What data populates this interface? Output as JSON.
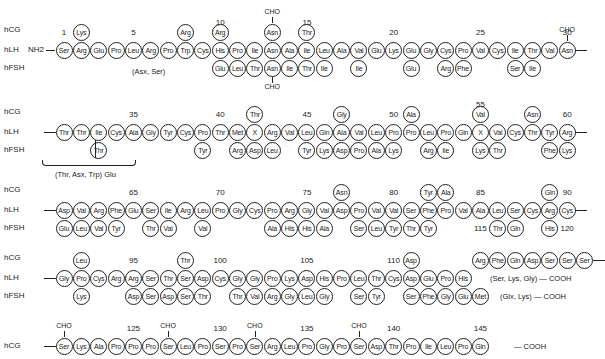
{
  "layout": {
    "x0": 64,
    "pitch": 17.35
  },
  "rows": [
    {
      "y": 50,
      "labels": {
        "hCG": "hCG",
        "hLH": "hLH",
        "hFSH": "hFSH"
      },
      "start_text": "NH2",
      "main": [
        "Ser",
        "Arg",
        "Glu",
        "Pro",
        "Leu",
        "Arg",
        "Pro",
        "Trp",
        "Cys",
        "His",
        "Pro",
        "Ile",
        "Asn",
        "Ala",
        "Ile",
        "Leu",
        "Ala",
        "Val",
        "Glu",
        "Lys",
        "Glu",
        "Gly",
        "Cys",
        "Pro",
        "Val",
        "Cys",
        "Ile",
        "Thr",
        "Val",
        "Asn"
      ],
      "numbers": [
        {
          "i": 0,
          "text": "1"
        },
        {
          "i": 4,
          "text": "5"
        },
        {
          "i": 9,
          "text": "10"
        },
        {
          "i": 14,
          "text": "15"
        },
        {
          "i": 19,
          "text": "20"
        },
        {
          "i": 24,
          "text": "25"
        },
        {
          "i": 29,
          "text": "30"
        }
      ],
      "above": [
        {
          "i": 1,
          "aa": "Lys"
        },
        {
          "i": 7,
          "aa": "Arg"
        },
        {
          "i": 9,
          "aa": "Arg"
        },
        {
          "i": 12,
          "aa": "Asn"
        },
        {
          "i": 14,
          "aa": "Thr"
        }
      ],
      "below": [
        {
          "i": 9,
          "aa": "Glu"
        },
        {
          "i": 10,
          "aa": "Leu"
        },
        {
          "i": 11,
          "aa": "Thr"
        },
        {
          "i": 12,
          "aa": "Asn"
        },
        {
          "i": 13,
          "aa": "Ile"
        },
        {
          "i": 14,
          "aa": "Thr"
        },
        {
          "i": 15,
          "aa": "Ile"
        },
        {
          "i": 17,
          "aa": "Ile"
        },
        {
          "i": 20,
          "aa": "Glu"
        },
        {
          "i": 22,
          "aa": "Arg"
        },
        {
          "i": 23,
          "aa": "Phe"
        },
        {
          "i": 26,
          "aa": "Ser"
        },
        {
          "i": 27,
          "aa": "Ile"
        }
      ],
      "cho_above": [
        {
          "i": 12
        },
        {
          "i": 29
        }
      ],
      "cho_below": [
        {
          "i": 12
        }
      ],
      "notes": [
        {
          "text": "(Asx, Ser)",
          "x": 132,
          "y": 67
        }
      ],
      "end_bond": true
    },
    {
      "y": 132,
      "labels": {
        "hCG": "hCG",
        "hLH": "hLH",
        "hFSH": "hFSH"
      },
      "main": [
        "Thr",
        "Thr",
        "Ile",
        "Cys",
        "Ala",
        "Gly",
        "Tyr",
        "Cys",
        "Pro",
        "Thr",
        "Met",
        "X",
        "Arg",
        "Val",
        "Leu",
        "Gln",
        "Ala",
        "Val",
        "Leu",
        "Pro",
        "Pro",
        "Leu",
        "Pro",
        "Gln",
        "X",
        "Val",
        "Cys",
        "Thr",
        "Tyr",
        "Arg"
      ],
      "numbers": [
        {
          "i": 4,
          "text": "35"
        },
        {
          "i": 9,
          "text": "40"
        },
        {
          "i": 14,
          "text": "45"
        },
        {
          "i": 19,
          "text": "50"
        },
        {
          "i": 24,
          "text": "55"
        },
        {
          "i": 29,
          "text": "60"
        }
      ],
      "above": [
        {
          "i": 11,
          "aa": "Thr"
        },
        {
          "i": 16,
          "aa": "Gly"
        },
        {
          "i": 20,
          "aa": "Ala"
        },
        {
          "i": 24,
          "aa": "Val"
        },
        {
          "i": 27,
          "aa": "Asn"
        }
      ],
      "below": [
        {
          "i": 2,
          "aa": "Thr"
        },
        {
          "i": 8,
          "aa": "Tyr"
        },
        {
          "i": 10,
          "aa": "Arg"
        },
        {
          "i": 11,
          "aa": "Asp"
        },
        {
          "i": 12,
          "aa": "Leu"
        },
        {
          "i": 14,
          "aa": "Tyr"
        },
        {
          "i": 15,
          "aa": "Lys"
        },
        {
          "i": 16,
          "aa": "Asp"
        },
        {
          "i": 17,
          "aa": "Pro"
        },
        {
          "i": 18,
          "aa": "Ala"
        },
        {
          "i": 19,
          "aa": "Lys"
        },
        {
          "i": 21,
          "aa": "Arg"
        },
        {
          "i": 22,
          "aa": "Ile"
        },
        {
          "i": 24,
          "aa": "Lys"
        },
        {
          "i": 25,
          "aa": "Thr"
        },
        {
          "i": 28,
          "aa": "Phe"
        },
        {
          "i": 29,
          "aa": "Lys"
        }
      ],
      "cho_above": [],
      "cho_below": [],
      "notes": [
        {
          "text": "(Thr, Asx, Trp) Glu",
          "x": 55,
          "y": 170
        }
      ],
      "brace": {
        "x": 42,
        "y": 160,
        "w": 92
      },
      "end_bond": true
    },
    {
      "y": 210,
      "labels": {
        "hCG": "hCG",
        "hLH": "hLH",
        "hFSH": "hFSH"
      },
      "main": [
        "Asp",
        "Val",
        "Arg",
        "Phe",
        "Glu",
        "Ser",
        "Ile",
        "Arg",
        "Leu",
        "Pro",
        "Gly",
        "Cys",
        "Pro",
        "Arg",
        "Gly",
        "Val",
        "Asp",
        "Pro",
        "Val",
        "Val",
        "Ser",
        "Phe",
        "Pro",
        "Val",
        "Ala",
        "Leu",
        "Ser",
        "Cys",
        "Arg",
        "Cys"
      ],
      "numbers": [
        {
          "i": 4,
          "text": "65"
        },
        {
          "i": 9,
          "text": "70"
        },
        {
          "i": 14,
          "text": "75"
        },
        {
          "i": 19,
          "text": "80"
        },
        {
          "i": 24,
          "text": "85"
        },
        {
          "i": 29,
          "text": "90"
        }
      ],
      "above": [
        {
          "i": 16,
          "aa": "Asn"
        },
        {
          "i": 21,
          "aa": "Tyr"
        },
        {
          "i": 22,
          "aa": "Ala"
        },
        {
          "i": 28,
          "aa": "Gln"
        }
      ],
      "below": [
        {
          "i": 0,
          "aa": "Glu"
        },
        {
          "i": 1,
          "aa": "Leu"
        },
        {
          "i": 2,
          "aa": "Val"
        },
        {
          "i": 3,
          "aa": "Tyr"
        },
        {
          "i": 5,
          "aa": "Thr"
        },
        {
          "i": 6,
          "aa": "Val"
        },
        {
          "i": 8,
          "aa": "Val"
        },
        {
          "i": 12,
          "aa": "Ala"
        },
        {
          "i": 13,
          "aa": "His"
        },
        {
          "i": 14,
          "aa": "His"
        },
        {
          "i": 15,
          "aa": "Ala"
        },
        {
          "i": 17,
          "aa": "Ser"
        },
        {
          "i": 18,
          "aa": "Leu"
        },
        {
          "i": 19,
          "aa": "Tyr"
        },
        {
          "i": 20,
          "aa": "Thr"
        },
        {
          "i": 21,
          "aa": "Tyr"
        },
        {
          "i": 25,
          "aa": "Thr"
        },
        {
          "i": 26,
          "aa": "Gln"
        },
        {
          "i": 28,
          "aa": "His"
        }
      ],
      "cho_above": [],
      "cho_below": [],
      "notes": [],
      "end_bond": true
    },
    {
      "y": 278,
      "labels": {
        "hCG": "hCG",
        "hLH": "hLH",
        "hFSH": "hFSH"
      },
      "main": [
        "Gly",
        "Pro",
        "Cys",
        "Arg",
        "Arg",
        "Ser",
        "Thr",
        "Ser",
        "Asp",
        "Cys",
        "Gly",
        "Gly",
        "Pro",
        "Lys",
        "Asp",
        "His",
        "Pro",
        "Leu",
        "Thr",
        "Cys",
        "Asp",
        "Glu",
        "Pro",
        "His"
      ],
      "numbers": [
        {
          "i": 4,
          "text": "95"
        },
        {
          "i": 9,
          "text": "100"
        },
        {
          "i": 14,
          "text": "105"
        },
        {
          "i": 19,
          "text": "110"
        },
        {
          "i": 24,
          "text": "115",
          "dy": -22
        },
        {
          "i": 29,
          "text": "120",
          "dy": -22
        }
      ],
      "above": [
        {
          "i": 1,
          "aa": "Leu"
        },
        {
          "i": 7,
          "aa": "Thr"
        },
        {
          "i": 20,
          "aa": "Asp"
        },
        {
          "i": 24,
          "aa": "Arg"
        },
        {
          "i": 25,
          "aa": "Phe"
        },
        {
          "i": 26,
          "aa": "Gln"
        },
        {
          "i": 27,
          "aa": "Asp"
        },
        {
          "i": 28,
          "aa": "Ser"
        },
        {
          "i": 29,
          "aa": "Ser"
        },
        {
          "i": 30,
          "aa": "Ser"
        }
      ],
      "below": [
        {
          "i": 1,
          "aa": "Lys"
        },
        {
          "i": 4,
          "aa": "Asp"
        },
        {
          "i": 5,
          "aa": "Ser"
        },
        {
          "i": 6,
          "aa": "Asp"
        },
        {
          "i": 7,
          "aa": "Ser"
        },
        {
          "i": 8,
          "aa": "Thr"
        },
        {
          "i": 10,
          "aa": "Thr"
        },
        {
          "i": 11,
          "aa": "Val"
        },
        {
          "i": 12,
          "aa": "Arg"
        },
        {
          "i": 13,
          "aa": "Gly"
        },
        {
          "i": 14,
          "aa": "Leu"
        },
        {
          "i": 15,
          "aa": "Gly"
        },
        {
          "i": 17,
          "aa": "Ser"
        },
        {
          "i": 18,
          "aa": "Tyr"
        },
        {
          "i": 20,
          "aa": "Ser"
        },
        {
          "i": 21,
          "aa": "Phe"
        },
        {
          "i": 22,
          "aa": "Gly"
        },
        {
          "i": 23,
          "aa": "Glu"
        },
        {
          "i": 24,
          "aa": "Met"
        }
      ],
      "cho_above": [],
      "cho_below": [],
      "notes": [
        {
          "text": "(Ser, Lys, Gly) — COOH",
          "x": 490,
          "y": 274
        },
        {
          "text": "(Glx, Lys) — COOH",
          "x": 500,
          "y": 292
        }
      ],
      "hcg_tail_bond": true,
      "end_bond": false
    },
    {
      "y": 346,
      "labels": {
        "hCG": "hCG"
      },
      "main": [
        "Ser",
        "Lys",
        "Ala",
        "Pro",
        "Pro",
        "Pro",
        "Ser",
        "Leu",
        "Pro",
        "Ser",
        "Pro",
        "Ser",
        "Arg",
        "Leu",
        "Pro",
        "Gly",
        "Pro",
        "Ser",
        "Asp",
        "Thr",
        "Pro",
        "Ile",
        "Leu",
        "Pro",
        "Gln"
      ],
      "numbers": [
        {
          "i": 4,
          "text": "125"
        },
        {
          "i": 9,
          "text": "130"
        },
        {
          "i": 14,
          "text": "135"
        },
        {
          "i": 19,
          "text": "140"
        },
        {
          "i": 24,
          "text": "145"
        }
      ],
      "above": [],
      "below": [],
      "cho_above": [
        {
          "i": 0
        },
        {
          "i": 6
        },
        {
          "i": 11
        },
        {
          "i": 17
        }
      ],
      "cho_below": [],
      "notes": [
        {
          "text": "— COOH",
          "x": 514,
          "y": 342
        }
      ],
      "end_bond": false
    }
  ],
  "legend": {
    "hCG": "hCG",
    "hLH": "hLH",
    "hFSH": "hFSH",
    "cho": "CHO"
  }
}
